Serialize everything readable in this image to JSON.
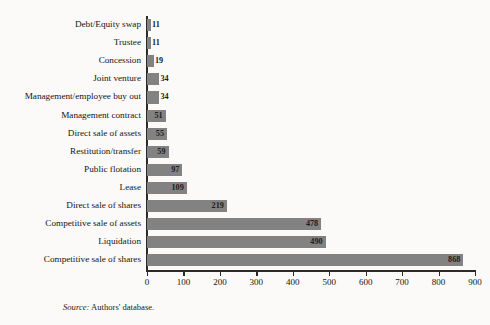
{
  "chart_data": {
    "type": "bar",
    "orientation": "horizontal",
    "title": "",
    "xlabel": "",
    "ylabel": "",
    "xlim": [
      0,
      900
    ],
    "grid": false,
    "legend": null,
    "bar_color": "#828282",
    "axis_color": "#2b2b2b",
    "background": "#fbfaf8",
    "xticks": [
      0,
      100,
      200,
      300,
      400,
      500,
      600,
      700,
      800,
      900
    ],
    "xtick_labels": [
      "0",
      "100",
      "200",
      "300",
      "400",
      "500",
      "600",
      "700",
      "800",
      "900"
    ],
    "categories": [
      "Debt/Equity swap",
      "Trustee",
      "Concession",
      "Joint venture",
      "Management/employee buy out",
      "Management contract",
      "Direct sale of assets",
      "Restitution/transfer",
      "Public flotation",
      "Lease",
      "Direct sale of shares",
      "Competitive sale of assets",
      "Liquidation",
      "Competitive sale of shares"
    ],
    "values": [
      11,
      11,
      19,
      34,
      34,
      51,
      55,
      59,
      97,
      109,
      219,
      478,
      490,
      868
    ],
    "value_labels": [
      "11",
      "11",
      "19",
      "34",
      "34",
      "51",
      "55",
      "59",
      "97",
      "109",
      "219",
      "478",
      "490",
      "868"
    ]
  },
  "footer": {
    "source_word": "Source:",
    "source_text": " Authors' database."
  }
}
